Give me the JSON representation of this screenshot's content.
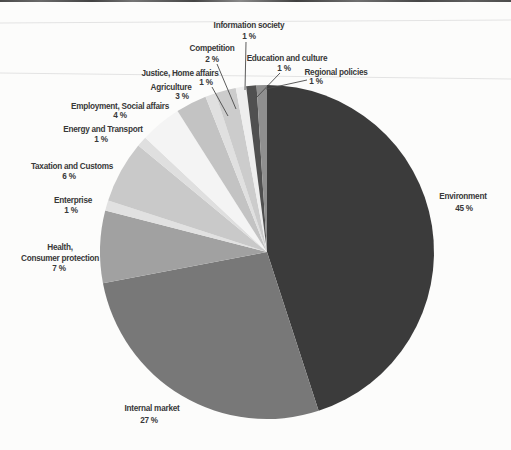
{
  "page": {
    "background": "#fcfcfb",
    "text_color": "#383838",
    "leader_line_color": "#4a4a4a",
    "scan_line_color": "#e3e3e3",
    "top_edge_color": "#4a4a4a"
  },
  "chart_data": {
    "type": "pie",
    "title": "",
    "total": 100,
    "direction": "clockwise",
    "start_angle_deg": 0,
    "center": {
      "x": 267,
      "y": 252
    },
    "radius": 167,
    "legend_position": "none",
    "categories": [
      "Environment",
      "Internal market",
      "Health, Consumer protection",
      "Enterprise",
      "Taxation and Customs",
      "Energy and Transport",
      "Employment, Social affairs",
      "Agriculture",
      "Justice, Home affairs",
      "Competition",
      "Information society",
      "Education and culture",
      "Regional policies"
    ],
    "values": [
      45,
      27,
      7,
      1,
      6,
      1,
      4,
      3,
      1,
      2,
      1,
      1,
      1
    ],
    "segments": [
      {
        "slug": "environment",
        "name": "Environment",
        "value": 45,
        "color": "#3b3b3b",
        "label_lines": [
          {
            "text": "Environment",
            "x": 463,
            "y": 199
          },
          {
            "text": "45 %",
            "x": 464,
            "y": 211
          }
        ],
        "leader": null
      },
      {
        "slug": "internal-market",
        "name": "Internal market",
        "value": 27,
        "color": "#787878",
        "label_lines": [
          {
            "text": "Internal market",
            "x": 152,
            "y": 411
          },
          {
            "text": "27 %",
            "x": 149,
            "y": 423
          }
        ],
        "leader": null
      },
      {
        "slug": "health-consumer-protection",
        "name": "Health, Consumer protection",
        "value": 7,
        "color": "#a1a1a1",
        "label_lines": [
          {
            "text": "Health,",
            "x": 60,
            "y": 250
          },
          {
            "text": "Consumer protection",
            "x": 60,
            "y": 261
          },
          {
            "text": "7 %",
            "x": 59,
            "y": 271
          }
        ],
        "leader": null
      },
      {
        "slug": "enterprise",
        "name": "Enterprise",
        "value": 1,
        "color": "#e1e1e1",
        "label_lines": [
          {
            "text": "Enterprise",
            "x": 73,
            "y": 203
          },
          {
            "text": "1 %",
            "x": 71,
            "y": 213
          }
        ],
        "leader": null
      },
      {
        "slug": "taxation-and-customs",
        "name": "Taxation and Customs",
        "value": 6,
        "color": "#c9c9c9",
        "label_lines": [
          {
            "text": "Taxation and Customs",
            "x": 72,
            "y": 169
          },
          {
            "text": "6 %",
            "x": 69,
            "y": 179
          }
        ],
        "leader": null
      },
      {
        "slug": "energy-and-transport",
        "name": "Energy and Transport",
        "value": 1,
        "color": "#dfdfdf",
        "label_lines": [
          {
            "text": "Energy and Transport",
            "x": 103,
            "y": 132
          },
          {
            "text": "1 %",
            "x": 101,
            "y": 142
          }
        ],
        "leader": null
      },
      {
        "slug": "employment-social-affairs",
        "name": "Employment, Social affairs",
        "value": 4,
        "color": "#f4f4f4",
        "label_lines": [
          {
            "text": "Employment, Social affairs",
            "x": 120,
            "y": 109
          },
          {
            "text": "4 %",
            "x": 120,
            "y": 118
          }
        ],
        "leader": null
      },
      {
        "slug": "agriculture",
        "name": "Agriculture",
        "value": 3,
        "color": "#c3c3c3",
        "label_lines": [
          {
            "text": "Agriculture",
            "x": 171,
            "y": 90
          },
          {
            "text": "3 %",
            "x": 182,
            "y": 99
          }
        ],
        "leader": null
      },
      {
        "slug": "justice-home-affairs",
        "name": "Justice, Home affairs",
        "value": 1,
        "color": "#e0e0e0",
        "label_lines": [
          {
            "text": "Justice, Home affairs",
            "x": 180,
            "y": 76
          },
          {
            "text": "1 %",
            "x": 206,
            "y": 85
          }
        ],
        "leader": {
          "x1": 212,
          "y1": 87,
          "x2": 228,
          "y2": 116
        }
      },
      {
        "slug": "competition",
        "name": "Competition",
        "value": 2,
        "color": "#cccccc",
        "label_lines": [
          {
            "text": "Competition",
            "x": 212,
            "y": 51
          },
          {
            "text": "2 %",
            "x": 212,
            "y": 62
          }
        ],
        "leader": {
          "x1": 217,
          "y1": 64,
          "x2": 236,
          "y2": 109
        }
      },
      {
        "slug": "information-society",
        "name": "Information society",
        "value": 1,
        "color": "#eeeeee",
        "label_lines": [
          {
            "text": "Information society",
            "x": 249,
            "y": 28
          },
          {
            "text": "1 %",
            "x": 249,
            "y": 39
          }
        ],
        "leader": {
          "x1": 246,
          "y1": 42,
          "x2": 245,
          "y2": 90
        }
      },
      {
        "slug": "education-and-culture",
        "name": "Education and culture",
        "value": 1,
        "color": "#505050",
        "label_lines": [
          {
            "text": "Education and culture",
            "x": 287,
            "y": 61
          },
          {
            "text": "1 %",
            "x": 284,
            "y": 71
          }
        ],
        "leader": {
          "x1": 280,
          "y1": 73,
          "x2": 256,
          "y2": 98
        }
      },
      {
        "slug": "regional-policies",
        "name": "Regional policies",
        "value": 1,
        "color": "#8f8f8f",
        "label_lines": [
          {
            "text": "Regional policies",
            "x": 336,
            "y": 75
          },
          {
            "text": "1 %",
            "x": 316,
            "y": 84
          }
        ],
        "leader": {
          "x1": 307,
          "y1": 80,
          "x2": 266,
          "y2": 89
        }
      }
    ],
    "scan_artifact_lines": [
      {
        "x1": 0,
        "y1": 23,
        "x2": 511,
        "y2": 20
      },
      {
        "x1": 0,
        "y1": 73,
        "x2": 511,
        "y2": 79
      }
    ]
  }
}
